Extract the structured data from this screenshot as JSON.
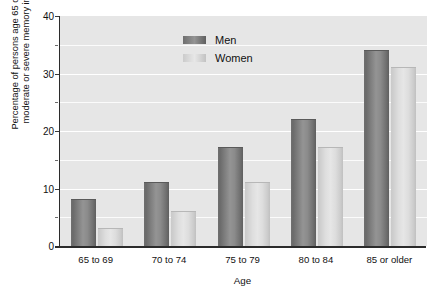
{
  "chart_data": {
    "type": "bar",
    "title": "",
    "subtitle": "",
    "categories": [
      "65 to 69",
      "70 to 74",
      "75 to 79",
      "80 to 84",
      "85 or older"
    ],
    "series": [
      {
        "name": "Men",
        "values": [
          8,
          11,
          17,
          22,
          34
        ],
        "color": "#8b8b8b"
      },
      {
        "name": "Women",
        "values": [
          3,
          6,
          11,
          17,
          31
        ],
        "color": "#dcdcdc"
      }
    ],
    "xlabel": "Age",
    "ylabel": "Percentage of persons age 65 or older with moderate or severe memory impairment",
    "ylabel_line1": "Percentage of persons age 65 or older with",
    "ylabel_line2": "moderate or severe memory impairment",
    "ylim": [
      0,
      40
    ],
    "ytick_labels": [
      "0",
      "10",
      "20",
      "30",
      "40"
    ],
    "ytick_values": [
      0,
      10,
      20,
      30,
      40
    ],
    "yminor_values": [
      5,
      15,
      25,
      35
    ],
    "grid": true,
    "grid_values": [
      5,
      10,
      15,
      20,
      25,
      30,
      35
    ],
    "legend_position": "top-left-inside",
    "plot_background": "#e6e6e6",
    "gridline_color": "#ffffff",
    "axis_color": "#2b2b2b"
  },
  "legend": {
    "entries": [
      {
        "label": "Men"
      },
      {
        "label": "Women"
      }
    ]
  }
}
